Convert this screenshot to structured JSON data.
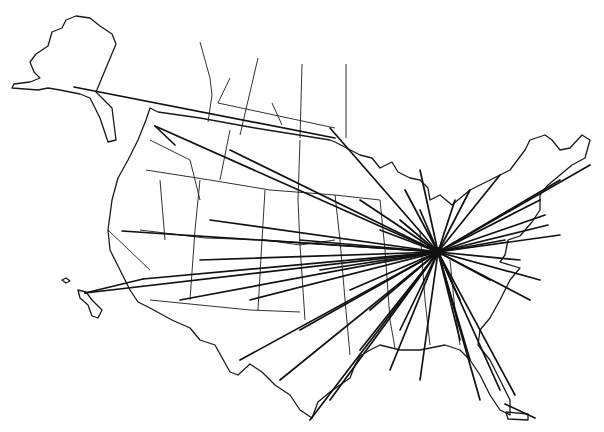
{
  "map": {
    "title": "",
    "description": "Route map of the United States with lines radiating from a central hub",
    "colors": {
      "background": "#ffffff",
      "ink": "#111111"
    },
    "hub": {
      "name": "hub",
      "coord": [
        438,
        252
      ]
    },
    "secondary_hubs": [
      {
        "name": "northwest-hub",
        "coord": [
          155,
          126
        ]
      },
      {
        "name": "bay-area-hub",
        "coord": [
          122,
          231
        ]
      },
      {
        "name": "southern-california-hub",
        "coord": [
          143,
          279
        ]
      }
    ],
    "routes_from_hub": [
      [
        155,
        126
      ],
      [
        122,
        231
      ],
      [
        143,
        279
      ],
      [
        85,
        293
      ],
      [
        210,
        220
      ],
      [
        230,
        150
      ],
      [
        330,
        128
      ],
      [
        262,
        240
      ],
      [
        200,
        260
      ],
      [
        180,
        300
      ],
      [
        250,
        300
      ],
      [
        300,
        330
      ],
      [
        240,
        360
      ],
      [
        280,
        380
      ],
      [
        330,
        400
      ],
      [
        310,
        420
      ],
      [
        360,
        350
      ],
      [
        390,
        370
      ],
      [
        400,
        330
      ],
      [
        420,
        380
      ],
      [
        460,
        340
      ],
      [
        470,
        360
      ],
      [
        480,
        400
      ],
      [
        500,
        390
      ],
      [
        515,
        395
      ],
      [
        530,
        300
      ],
      [
        540,
        280
      ],
      [
        520,
        260
      ],
      [
        560,
        235
      ],
      [
        545,
        215
      ],
      [
        540,
        200
      ],
      [
        560,
        180
      ],
      [
        590,
        165
      ],
      [
        500,
        175
      ],
      [
        470,
        190
      ],
      [
        455,
        200
      ],
      [
        420,
        210
      ],
      [
        400,
        220
      ],
      [
        380,
        230
      ],
      [
        360,
        200
      ],
      [
        300,
        240
      ],
      [
        320,
        270
      ],
      [
        350,
        290
      ],
      [
        370,
        310
      ],
      [
        460,
        300
      ],
      [
        490,
        280
      ],
      [
        505,
        240
      ],
      [
        548,
        225
      ],
      [
        420,
        170
      ],
      [
        405,
        190
      ]
    ],
    "other_routes": [
      [
        [
          74,
          87
        ],
        [
          335,
          138
        ]
      ],
      [
        [
          155,
          126
        ],
        [
          175,
          145
        ]
      ],
      [
        [
          143,
          279
        ],
        [
          85,
          293
        ]
      ],
      [
        [
          505,
          404
        ],
        [
          535,
          418
        ]
      ]
    ]
  }
}
